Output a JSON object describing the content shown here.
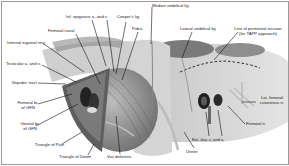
{
  "figure": {
    "type": "anatomical-illustration",
    "labels": {
      "median_umbilical": "Median umbilical lig.",
      "inf_epigastric": "Inf. epigastric a. and v.",
      "coopers": "Cooper's lig.",
      "femoral_canal": "Femoral canal",
      "pubis": "Pubis",
      "internal_ring": "Internal inguinal ring",
      "testicular": "Testicular a. and v.",
      "iliopubic": "Iliopubic tract",
      "femoral_br_1": "Femoral br.",
      "femoral_br_2": "of GFN",
      "genital_br_1": "Genital br.",
      "genital_br_2": "of GFN",
      "triangle_pain": "Triangle of Pain",
      "triangle_doom": "Triangle of Doom",
      "vas": "Vas deferens",
      "lateral_umbilical": "Lateral umbilical lig.",
      "peritoneal_line_1": "Line of peritoneal incision",
      "peritoneal_line_2": "(for TAPP approach)",
      "lat_femoral_1": "Lat. femoral",
      "lat_femoral_2": "cutaneous n.",
      "femoral_n": "Femoral n.",
      "ext_iliac": "Ext. iliac v. and a.",
      "ureter": "Ureter"
    },
    "colors": {
      "tissue_light": "#d8d8d8",
      "tissue_mid": "#a8a8a8",
      "tissue_dark": "#5a5a5a",
      "leader_line": "#111111",
      "border": "#9a9a9a"
    }
  }
}
